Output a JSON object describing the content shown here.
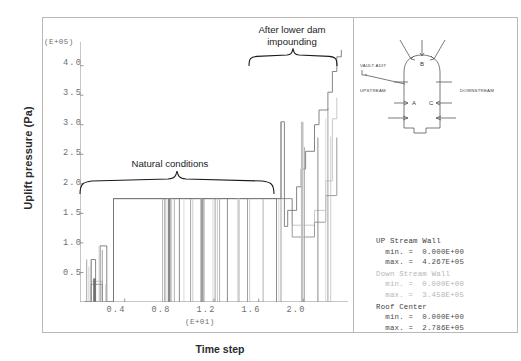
{
  "axes": {
    "y_title": "Uplift pressure (Pa)",
    "x_title": "Time step",
    "y_multiplier": "(E+05)",
    "x_multiplier": "(E+01)",
    "y_ticks": [
      "4.0",
      "3.5",
      "3.0",
      "2.5",
      "2.0",
      "1.5",
      "1.0",
      "0.5"
    ],
    "x_ticks": [
      "0.4",
      "0.8",
      "1.2",
      "1.6",
      "2.0"
    ]
  },
  "annotations": {
    "natural": "Natural conditions",
    "impounding_line1": "After lower dam",
    "impounding_line2": "impounding"
  },
  "diagram": {
    "vault_adit": "VAULT ADIT",
    "upstream": "UPSTREAM",
    "downstream": "DOWNSTREAM",
    "point_a": "A",
    "point_b": "B",
    "point_c": "C"
  },
  "stats": [
    {
      "name": "UP Stream Wall",
      "dim": false,
      "min_label": "min. =",
      "min_value": "0.000E+00",
      "max_label": "max. =",
      "max_value": "4.267E+05"
    },
    {
      "name": "Down Stream Wall",
      "dim": true,
      "min_label": "min. =",
      "min_value": "0.000E+00",
      "max_label": "max. =",
      "max_value": "3.458E+05"
    },
    {
      "name": "Roof Center",
      "dim": false,
      "min_label": "min. =",
      "min_value": "0.000E+00",
      "max_label": "max. =",
      "max_value": "2.786E+05"
    }
  ],
  "colors": {
    "series_upstream": "#6f6f6f",
    "series_downstream": "#c8c8c8",
    "series_roof": "#9a9a9a",
    "frame": "#b9b9b9",
    "text": "#1b1b1b"
  },
  "chart_data": {
    "type": "line",
    "title": "",
    "xlabel": "Time step",
    "ylabel": "Uplift pressure (Pa)",
    "x_multiplier": 10,
    "y_multiplier": 100000,
    "xlim": [
      0,
      24
    ],
    "ylim": [
      0,
      4.4
    ],
    "grid": false,
    "legend": "right-panel",
    "series": [
      {
        "name": "UP Stream Wall",
        "color": "#6f6f6f",
        "min": 0.0,
        "max": 4.267,
        "x": [
          0.4,
          1.0,
          1.4,
          1.8,
          2.4,
          3.0,
          4.0,
          5.0,
          6.0,
          7.0,
          7.6,
          8.0,
          8.4,
          8.8,
          9.2,
          9.6,
          10.2,
          10.6,
          11.0,
          11.6,
          12.0,
          12.6,
          13.0,
          13.6,
          14.0,
          14.6,
          15.2,
          15.8,
          16.4,
          17.0,
          17.6,
          18.0,
          18.3,
          18.6,
          19.0,
          19.4,
          19.8,
          20.2,
          20.6,
          21.0,
          21.4,
          21.8,
          22.2,
          22.6,
          23.0,
          23.4
        ],
        "y": [
          0.0,
          0.72,
          0.0,
          0.95,
          0.0,
          1.75,
          1.75,
          1.75,
          1.75,
          1.75,
          1.75,
          1.75,
          1.75,
          1.75,
          1.75,
          1.75,
          1.75,
          1.75,
          1.75,
          1.75,
          1.75,
          1.75,
          1.75,
          1.75,
          1.75,
          1.75,
          1.75,
          1.75,
          1.75,
          1.75,
          1.75,
          3.05,
          1.28,
          1.55,
          1.55,
          1.95,
          2.25,
          2.55,
          2.55,
          3.0,
          3.25,
          3.25,
          3.55,
          3.9,
          4.15,
          4.267
        ]
      },
      {
        "name": "Down Stream Wall",
        "color": "#c8c8c8",
        "min": 0.0,
        "max": 3.458,
        "x": [
          0.4,
          1.0,
          2.0,
          3.0,
          8.0,
          9.0,
          10.0,
          12.0,
          14.0,
          16.0,
          18.0,
          19.0,
          20.0,
          21.0,
          22.0,
          22.6,
          23.0
        ],
        "y": [
          0.0,
          0.35,
          0.0,
          1.75,
          1.75,
          1.75,
          1.75,
          1.75,
          1.75,
          1.75,
          1.75,
          1.3,
          1.3,
          1.55,
          2.05,
          3.1,
          3.458
        ]
      },
      {
        "name": "Roof Center",
        "color": "#9a9a9a",
        "min": 0.0,
        "max": 2.786,
        "x": [
          0.4,
          1.0,
          2.0,
          3.0,
          8.0,
          10.0,
          12.0,
          14.0,
          16.0,
          18.0,
          19.0,
          20.0,
          21.0,
          22.0,
          23.0
        ],
        "y": [
          0.0,
          0.3,
          0.0,
          1.75,
          1.75,
          1.75,
          1.75,
          1.75,
          1.75,
          1.75,
          1.1,
          1.1,
          1.35,
          1.8,
          2.786
        ]
      }
    ]
  }
}
